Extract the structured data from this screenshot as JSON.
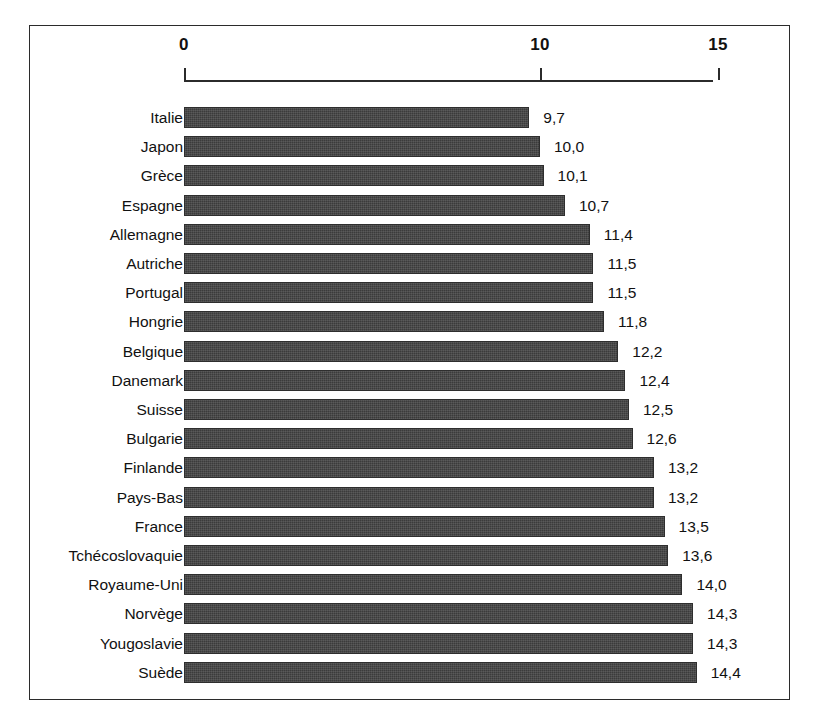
{
  "chart_data": {
    "type": "bar",
    "orientation": "horizontal",
    "title": "",
    "subtitle": "",
    "xlabel": "",
    "ylabel": "",
    "xlim": [
      0,
      15
    ],
    "grid": false,
    "legend": null,
    "axis_position": "top",
    "tick_labels": [
      "0",
      "10",
      "15"
    ],
    "tick_values": [
      0,
      10,
      15
    ],
    "decimal_separator": ",",
    "categories": [
      "Italie",
      "Japon",
      "Grèce",
      "Espagne",
      "Allemagne",
      "Autriche",
      "Portugal",
      "Hongrie",
      "Belgique",
      "Danemark",
      "Suisse",
      "Bulgarie",
      "Finlande",
      "Pays-Bas",
      "France",
      "Tchécoslovaquie",
      "Royaume-Uni",
      "Norvège",
      "Yougoslavie",
      "Suède"
    ],
    "values": [
      9.7,
      10.0,
      10.1,
      10.7,
      11.4,
      11.5,
      11.5,
      11.8,
      12.2,
      12.4,
      12.5,
      12.6,
      13.2,
      13.2,
      13.5,
      13.6,
      14.0,
      14.3,
      14.3,
      14.4
    ],
    "value_labels": [
      "9,7",
      "10,0",
      "10,1",
      "10,7",
      "11,4",
      "11,5",
      "11,5",
      "11,8",
      "12,2",
      "12,4",
      "12,5",
      "12,6",
      "13,2",
      "13,2",
      "13,5",
      "13,6",
      "14,0",
      "14,3",
      "14,3",
      "14,4"
    ],
    "bar_color": "#3b3b3b",
    "frame_color": "#2b2b2b",
    "background_color": "#ffffff"
  }
}
